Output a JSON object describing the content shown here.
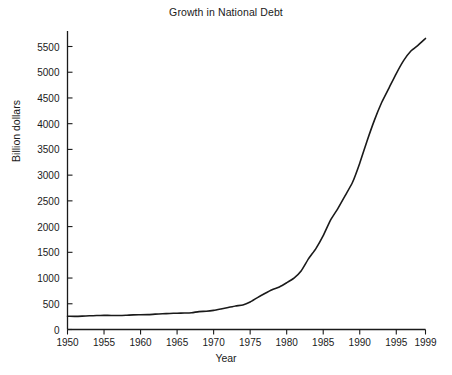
{
  "chart_data": {
    "type": "line",
    "title": "Growth in National Debt",
    "xlabel": "Year",
    "ylabel": "Billion dollars",
    "xlim": [
      1950,
      1999
    ],
    "ylim": [
      0,
      5800
    ],
    "grid": false,
    "legend": null,
    "xticks": [
      1950,
      1955,
      1960,
      1965,
      1970,
      1975,
      1980,
      1985,
      1990,
      1995,
      1999
    ],
    "xtick_labels": [
      "1950",
      "1955",
      "1960",
      "1965",
      "1970",
      "1975",
      "1980",
      "1985",
      "1990",
      "1995",
      "1999"
    ],
    "yticks": [
      0,
      500,
      1000,
      1500,
      2000,
      2500,
      3000,
      3500,
      4000,
      4500,
      5000,
      5500
    ],
    "ytick_labels": [
      "0",
      "500",
      "1000",
      "1500",
      "2000",
      "2500",
      "3000",
      "3500",
      "4000",
      "4500",
      "5000",
      "5500"
    ],
    "line_color": "#1a1a1a",
    "line_width": 1.6,
    "x": [
      1950,
      1951,
      1952,
      1953,
      1954,
      1955,
      1956,
      1957,
      1958,
      1959,
      1960,
      1961,
      1962,
      1963,
      1964,
      1965,
      1966,
      1967,
      1968,
      1969,
      1970,
      1971,
      1972,
      1973,
      1974,
      1975,
      1976,
      1977,
      1978,
      1979,
      1980,
      1981,
      1982,
      1983,
      1984,
      1985,
      1986,
      1987,
      1988,
      1989,
      1990,
      1991,
      1992,
      1993,
      1994,
      1995,
      1996,
      1997,
      1998,
      1999
    ],
    "values": [
      257,
      255,
      259,
      266,
      271,
      274,
      273,
      271,
      276,
      285,
      287,
      289,
      298,
      306,
      312,
      317,
      320,
      326,
      348,
      354,
      371,
      398,
      427,
      458,
      475,
      533,
      620,
      699,
      772,
      827,
      908,
      998,
      1142,
      1377,
      1572,
      1823,
      2125,
      2350,
      2602,
      2857,
      3233,
      3665,
      4065,
      4411,
      4693,
      4974,
      5225,
      5413,
      5526,
      5656
    ],
    "series": [
      {
        "name": "National debt",
        "values": [
          257,
          255,
          259,
          266,
          271,
          274,
          273,
          271,
          276,
          285,
          287,
          289,
          298,
          306,
          312,
          317,
          320,
          326,
          348,
          354,
          371,
          398,
          427,
          458,
          475,
          533,
          620,
          699,
          772,
          827,
          908,
          998,
          1142,
          1377,
          1572,
          1823,
          2125,
          2350,
          2602,
          2857,
          3233,
          3665,
          4065,
          4411,
          4693,
          4974,
          5225,
          5413,
          5526,
          5656
        ]
      }
    ],
    "axis": {
      "spines": [
        "left",
        "bottom"
      ],
      "tick_direction": "out",
      "axis_color": "#1a1a1a"
    }
  }
}
